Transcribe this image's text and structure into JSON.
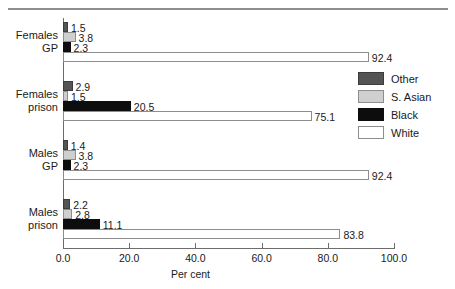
{
  "chart_data": {
    "type": "bar",
    "orientation": "horizontal",
    "title": "",
    "xlabel": "Per cent",
    "ylabel": "",
    "xlim": [
      0.0,
      100.0
    ],
    "xticks": [
      "0.0",
      "20.0",
      "40.0",
      "60.0",
      "80.0",
      "100.0"
    ],
    "xtick_values": [
      0.0,
      20.0,
      40.0,
      60.0,
      80.0,
      100.0
    ],
    "grid": false,
    "legend_position": "right",
    "categories": [
      "Females GP",
      "Females prison",
      "Males GP",
      "Males prison"
    ],
    "category_lines": [
      [
        "Females",
        "GP"
      ],
      [
        "Females",
        "prison"
      ],
      [
        "Males",
        "GP"
      ],
      [
        "Males",
        "prison"
      ]
    ],
    "series": [
      {
        "name": "Other",
        "color": "#545454",
        "values": [
          1.5,
          2.9,
          1.4,
          2.2
        ]
      },
      {
        "name": "S. Asian",
        "color": "#cfcfcf",
        "values": [
          3.8,
          1.5,
          3.8,
          2.8
        ]
      },
      {
        "name": "Black",
        "color": "#0d0d0d",
        "values": [
          2.3,
          20.5,
          2.3,
          11.1
        ]
      },
      {
        "name": "White",
        "color": "#ffffff",
        "values": [
          92.4,
          75.1,
          92.4,
          83.8
        ]
      }
    ],
    "value_labels": [
      [
        "1.5",
        "3.8",
        "2.3",
        "92.4"
      ],
      [
        "2.9",
        "1.5",
        "20.5",
        "75.1"
      ],
      [
        "1.4",
        "3.8",
        "2.3",
        "92.4"
      ],
      [
        "2.2",
        "2.8",
        "11.1",
        "83.8"
      ]
    ]
  },
  "legend": {
    "items": [
      {
        "label": "Other",
        "swatch": "other"
      },
      {
        "label": "S. Asian",
        "swatch": "sasian"
      },
      {
        "label": "Black",
        "swatch": "black"
      },
      {
        "label": "White",
        "swatch": "white"
      }
    ]
  },
  "axis": {
    "x_title": "Per cent",
    "ticks": [
      "0.0",
      "20.0",
      "40.0",
      "60.0",
      "80.0",
      "100.0"
    ]
  },
  "groups": [
    {
      "line1": "Females",
      "line2": "GP",
      "bars": [
        {
          "series": "Other",
          "value": 1.5,
          "label": "1.5"
        },
        {
          "series": "S. Asian",
          "value": 3.8,
          "label": "3.8"
        },
        {
          "series": "Black",
          "value": 2.3,
          "label": "2.3"
        },
        {
          "series": "White",
          "value": 92.4,
          "label": "92.4"
        }
      ]
    },
    {
      "line1": "Females",
      "line2": "prison",
      "bars": [
        {
          "series": "Other",
          "value": 2.9,
          "label": "2.9"
        },
        {
          "series": "S. Asian",
          "value": 1.5,
          "label": "1.5"
        },
        {
          "series": "Black",
          "value": 20.5,
          "label": "20.5"
        },
        {
          "series": "White",
          "value": 75.1,
          "label": "75.1"
        }
      ]
    },
    {
      "line1": "Males",
      "line2": "GP",
      "bars": [
        {
          "series": "Other",
          "value": 1.4,
          "label": "1.4"
        },
        {
          "series": "S. Asian",
          "value": 3.8,
          "label": "3.8"
        },
        {
          "series": "Black",
          "value": 2.3,
          "label": "2.3"
        },
        {
          "series": "White",
          "value": 92.4,
          "label": "92.4"
        }
      ]
    },
    {
      "line1": "Males",
      "line2": "prison",
      "bars": [
        {
          "series": "Other",
          "value": 2.2,
          "label": "2.2"
        },
        {
          "series": "S. Asian",
          "value": 2.8,
          "label": "2.8"
        },
        {
          "series": "Black",
          "value": 11.1,
          "label": "11.1"
        },
        {
          "series": "White",
          "value": 83.8,
          "label": "83.8"
        }
      ]
    }
  ]
}
